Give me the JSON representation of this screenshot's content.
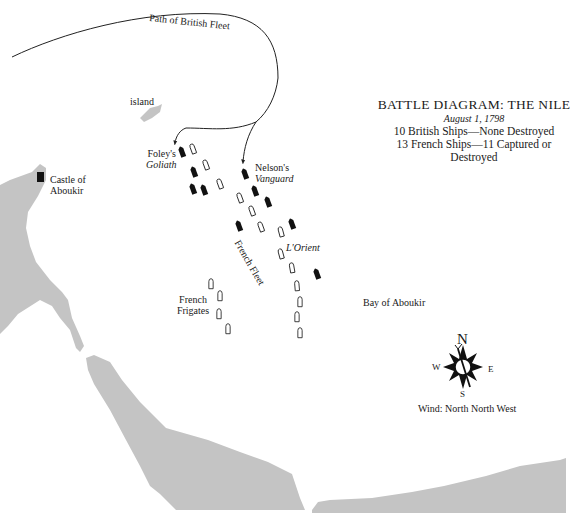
{
  "title_block": {
    "title": "BATTLE DIAGRAM: THE NILE",
    "date": "August 1, 1798",
    "british_summary": "10 British Ships—None Destroyed",
    "french_summary": "13 French Ships—11 Captured or Destroyed"
  },
  "labels": {
    "path": "Path of British Fleet",
    "island": "island",
    "castle_line1": "Castle of",
    "castle_line2": "Aboukir",
    "foley_line1": "Foley's",
    "foley_line2": "Goliath",
    "nelson_line1": "Nelson's",
    "nelson_line2": "Vanguard",
    "french_fleet": "French Fleet",
    "lorient": "L'Orient",
    "frigates_line1": "French",
    "frigates_line2": "Frigates",
    "bay": "Bay of Aboukir"
  },
  "compass": {
    "north": "N",
    "south": "S",
    "east": "E",
    "west": "W",
    "wind": "Wind: North North West"
  },
  "colors": {
    "land": "#c4c4c4",
    "british_ship": "#111111",
    "french_ship_outline": "#222222",
    "path": "#222222"
  }
}
